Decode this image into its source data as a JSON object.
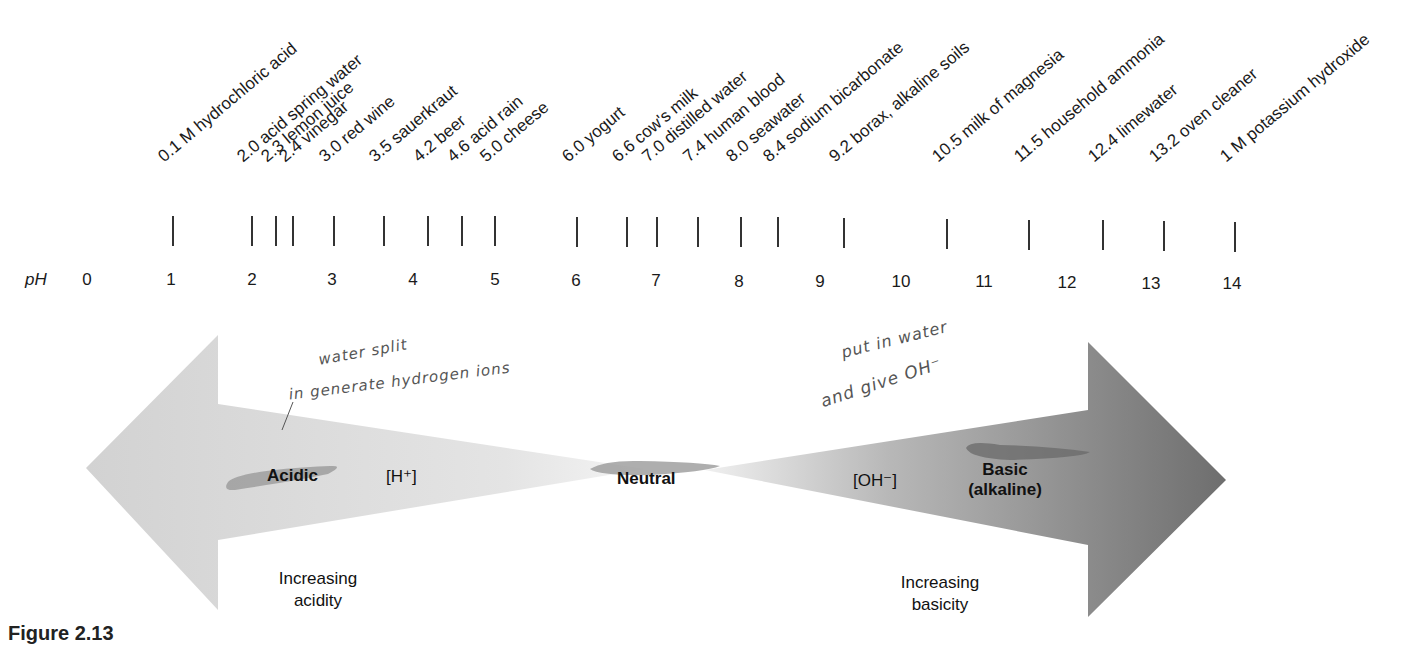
{
  "axis": {
    "label": "pH",
    "numbers": [
      "0",
      "1",
      "2",
      "3",
      "4",
      "5",
      "6",
      "7",
      "8",
      "9",
      "10",
      "11",
      "12",
      "13",
      "14"
    ]
  },
  "substances": [
    {
      "ph": 0.1,
      "label": "0.1 M hydrochloric acid"
    },
    {
      "ph": 2.0,
      "label": "2.0 acid spring water"
    },
    {
      "ph": 2.3,
      "label": "2.3 lemon juice"
    },
    {
      "ph": 2.4,
      "label": "2.4 vinegar"
    },
    {
      "ph": 3.0,
      "label": "3.0 red wine"
    },
    {
      "ph": 3.5,
      "label": "3.5 sauerkraut"
    },
    {
      "ph": 4.2,
      "label": "4.2 beer"
    },
    {
      "ph": 4.6,
      "label": "4.6 acid rain"
    },
    {
      "ph": 5.0,
      "label": "5.0 cheese"
    },
    {
      "ph": 6.0,
      "label": "6.0 yogurt"
    },
    {
      "ph": 6.6,
      "label": "6.6 cow's milk"
    },
    {
      "ph": 7.0,
      "label": "7.0 distilled water"
    },
    {
      "ph": 7.4,
      "label": "7.4 human blood"
    },
    {
      "ph": 8.0,
      "label": "8.0 seawater"
    },
    {
      "ph": 8.4,
      "label": "8.4 sodium bicarbonate"
    },
    {
      "ph": 9.2,
      "label": "9.2 borax, alkaline soils"
    },
    {
      "ph": 10.5,
      "label": "10.5 milk of magnesia"
    },
    {
      "ph": 11.5,
      "label": "11.5 household ammonia"
    },
    {
      "ph": 12.4,
      "label": "12.4 limewater"
    },
    {
      "ph": 13.2,
      "label": "13.2 oven cleaner"
    },
    {
      "ph": 14,
      "label": "1 M potassium hydroxide"
    }
  ],
  "arrows": {
    "acidic": {
      "label": "Acidic",
      "ion": "[H⁺]",
      "direction": "Increasing",
      "direction2": "acidity"
    },
    "neutral": {
      "label": "Neutral"
    },
    "basic": {
      "label": "Basic",
      "label2": "(alkaline)",
      "ion": "[OH⁻]",
      "direction": "Increasing",
      "direction2": "basicity"
    }
  },
  "annotations": {
    "acid_line1": "water split",
    "acid_line2": "in   generate hydrogen ions",
    "base_line1": "put in water",
    "base_line2": "and give OH⁻"
  },
  "caption": "Figure 2.13",
  "colors": {
    "acid_arrow": "#d4d4d4",
    "base_arrow": "#7a7a7a",
    "highlight": "#9a9a9a"
  }
}
